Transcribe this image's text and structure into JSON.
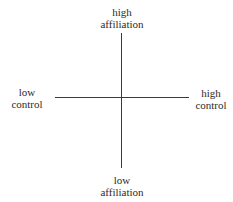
{
  "diagram": {
    "type": "quadrant-axes",
    "axes": {
      "vertical": {
        "name": "affiliation",
        "top_label": [
          "high",
          "affiliation"
        ],
        "bottom_label": [
          "low",
          "affiliation"
        ]
      },
      "horizontal": {
        "name": "control",
        "left_label": [
          "low",
          "control"
        ],
        "right_label": [
          "high",
          "control"
        ]
      }
    },
    "colors": {
      "line": "#3a3a3a",
      "text": "#2b2b2b",
      "background": "#ffffff"
    }
  }
}
